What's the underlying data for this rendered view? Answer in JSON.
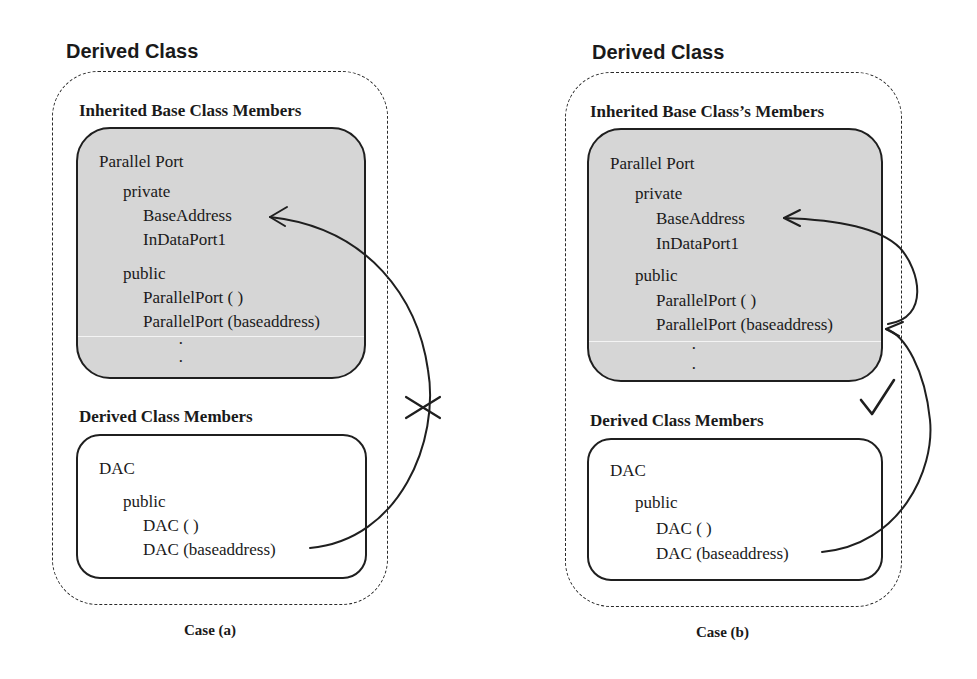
{
  "case_a": {
    "title": "Derived Class",
    "inherited_heading": "Inherited Base Class Members",
    "base_class": {
      "name": "Parallel Port",
      "private_label": "private",
      "private_members": [
        "BaseAddress",
        "InDataPort1"
      ],
      "public_label": "public",
      "public_members": [
        "ParallelPort ( )",
        "ParallelPort (baseaddress)"
      ],
      "ellipsis": [
        "·",
        "·"
      ]
    },
    "derived_heading": "Derived Class Members",
    "derived_class": {
      "name": "DAC",
      "public_label": "public",
      "public_members": [
        "DAC ( )",
        "DAC (baseaddress)"
      ]
    },
    "access_mark": "cross-mark",
    "caption": "Case (a)"
  },
  "case_b": {
    "title": "Derived Class",
    "inherited_heading": "Inherited Base Class’s Members",
    "base_class": {
      "name": "Parallel Port",
      "private_label": "private",
      "private_members": [
        "BaseAddress",
        "InDataPort1"
      ],
      "public_label": "public",
      "public_members": [
        "ParallelPort ( )",
        "ParallelPort (baseaddress)"
      ],
      "ellipsis": [
        "·",
        "·"
      ]
    },
    "derived_heading": "Derived Class Members",
    "derived_class": {
      "name": "DAC",
      "public_label": "public",
      "public_members": [
        "DAC ( )",
        "DAC (baseaddress)"
      ]
    },
    "access_mark": "check-mark",
    "caption": "Case (b)"
  },
  "colors": {
    "stroke": "#1f1f1f",
    "base_fill": "#d6d6d6",
    "background": "#ffffff"
  }
}
